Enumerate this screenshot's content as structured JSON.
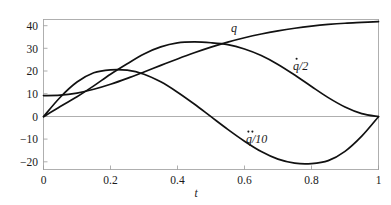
{
  "chart_data": {
    "type": "line",
    "title": "",
    "subtitle": "",
    "xlabel": "t",
    "ylabel": "",
    "xlim": [
      0,
      1
    ],
    "ylim": [
      -25,
      46
    ],
    "grid": false,
    "legend_position": "inline-annotations",
    "x_ticks": [
      "0",
      "0.2",
      "0.4",
      "0.6",
      "0.8",
      "1"
    ],
    "x_tick_values": [
      0,
      0.2,
      0.4,
      0.6,
      0.8,
      1
    ],
    "y_ticks": [
      "40",
      "30",
      "20",
      "10",
      "0",
      "−10",
      "−20"
    ],
    "y_tick_values": [
      40,
      30,
      20,
      10,
      0,
      -10,
      -20
    ],
    "x": [
      0,
      0.05,
      0.1,
      0.15,
      0.2,
      0.25,
      0.3,
      0.35,
      0.4,
      0.45,
      0.5,
      0.55,
      0.6,
      0.65,
      0.7,
      0.75,
      0.8,
      0.85,
      0.9,
      0.95,
      1
    ],
    "series": [
      {
        "name": "q",
        "label": "q",
        "values": [
          10.0,
          10.17,
          11.19,
          12.96,
          15.34,
          18.13,
          21.16,
          24.27,
          27.34,
          30.25,
          32.92,
          35.31,
          37.38,
          39.15,
          40.64,
          41.87,
          42.87,
          43.65,
          44.23,
          44.63,
          45.0
        ],
        "endpoints": {
          "start": 10,
          "end": 45
        },
        "color": "#111111"
      },
      {
        "name": "qdot_over_2",
        "label": "q̇/2",
        "label_parts": {
          "base": "q",
          "accent": "dot",
          "divisor": "2"
        },
        "values": [
          0.0,
          4.85,
          9.45,
          14.59,
          20.11,
          25.08,
          29.7,
          33.03,
          34.92,
          35.37,
          35.0,
          34.11,
          32.04,
          28.95,
          24.73,
          19.69,
          14.29,
          9.03,
          4.6,
          1.45,
          0.0
        ],
        "peak": {
          "t": 0.5,
          "value": 35
        },
        "endpoints": {
          "start": 0,
          "end": 0
        },
        "color": "#111111"
      },
      {
        "name": "qddot_over_10",
        "label": "q̈/10",
        "label_parts": {
          "base": "q",
          "accent": "ddot",
          "divisor": "10"
        },
        "values": [
          0.0,
          9.2,
          16.4,
          20.8,
          22.2,
          22.0,
          20.1,
          16.5,
          11.6,
          6.0,
          0.0,
          -6.0,
          -11.6,
          -16.5,
          -20.1,
          -22.0,
          -22.2,
          -20.8,
          -16.4,
          -9.2,
          0.0
        ],
        "peak": {
          "t": 0.25,
          "value": 22
        },
        "trough": {
          "t": 0.75,
          "value": -22
        },
        "zero_crossings": [
          0,
          0.5,
          1
        ],
        "endpoints": {
          "start": 0,
          "end": 0
        },
        "color": "#111111"
      }
    ],
    "annotations": [
      {
        "name": "label-q",
        "text": "q",
        "t": 0.57,
        "value": 38
      },
      {
        "name": "label-qdot",
        "text": "q̇/2",
        "t": 0.82,
        "value": 24
      },
      {
        "name": "label-qddot",
        "text": "q̈/10",
        "t": 0.6,
        "value": -9
      }
    ],
    "colors": {
      "curve": "#111111",
      "axis": "#9a9a9a",
      "text": "#1a1a1a",
      "background": "#ffffff"
    }
  }
}
